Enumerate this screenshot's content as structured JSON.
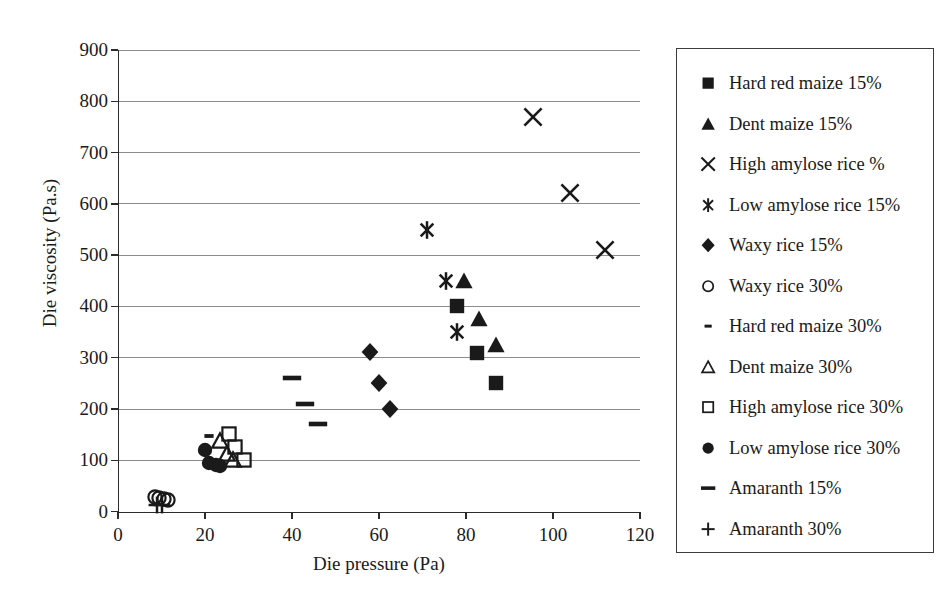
{
  "chart_data": {
    "type": "scatter",
    "title": "",
    "xlabel": "Die pressure (Pa)",
    "ylabel": "Die viscosity (Pa.s)",
    "xlim": [
      0,
      120
    ],
    "ylim": [
      0,
      900
    ],
    "xticks": [
      0,
      20,
      40,
      60,
      80,
      100,
      120
    ],
    "yticks": [
      0,
      100,
      200,
      300,
      400,
      500,
      600,
      700,
      800,
      900
    ],
    "grid": "horizontal",
    "legend_position": "right-outside",
    "series": [
      {
        "name": "Hard red maize 15%",
        "marker": "filled-square",
        "color": "#1a1a1a",
        "points": [
          [
            78,
            400
          ],
          [
            82.5,
            310
          ],
          [
            87,
            250
          ]
        ]
      },
      {
        "name": "Dent maize 15%",
        "marker": "filled-triangle",
        "color": "#1a1a1a",
        "points": [
          [
            79.5,
            450
          ],
          [
            83,
            375
          ],
          [
            87,
            325
          ]
        ]
      },
      {
        "name": "High amylose rice %",
        "marker": "cross-x",
        "color": "#1a1a1a",
        "points": [
          [
            95.5,
            770
          ],
          [
            104,
            622
          ],
          [
            112,
            510
          ]
        ]
      },
      {
        "name": "Low amylose rice 15%",
        "marker": "asterisk",
        "color": "#1a1a1a",
        "points": [
          [
            71,
            550
          ],
          [
            75.5,
            450
          ],
          [
            78,
            350
          ]
        ]
      },
      {
        "name": "Waxy rice 15%",
        "marker": "filled-diamond",
        "color": "#1a1a1a",
        "points": [
          [
            58,
            311
          ],
          [
            60,
            250
          ],
          [
            62.5,
            200
          ]
        ]
      },
      {
        "name": "Waxy rice 30%",
        "marker": "open-circle",
        "color": "#1a1a1a",
        "points": [
          [
            8.5,
            28
          ],
          [
            9.5,
            26
          ],
          [
            10.5,
            24
          ],
          [
            11.5,
            22
          ]
        ]
      },
      {
        "name": "Hard red maize 30%",
        "marker": "short-dash",
        "color": "#1a1a1a",
        "points": [
          [
            21,
            147
          ]
        ]
      },
      {
        "name": "Dent maize 30%",
        "marker": "open-triangle",
        "color": "#1a1a1a",
        "points": [
          [
            23.5,
            138
          ],
          [
            25,
            112
          ],
          [
            26.5,
            100
          ]
        ]
      },
      {
        "name": "High amylose rice 30%",
        "marker": "open-square",
        "color": "#1a1a1a",
        "points": [
          [
            25.5,
            152
          ],
          [
            27,
            125
          ],
          [
            29,
            100
          ]
        ]
      },
      {
        "name": "Low amylose rice 30%",
        "marker": "filled-circle",
        "color": "#1a1a1a",
        "points": [
          [
            20,
            120
          ],
          [
            21,
            95
          ],
          [
            22.5,
            90
          ],
          [
            23.5,
            88
          ]
        ]
      },
      {
        "name": "Amaranth 15%",
        "marker": "long-dash",
        "color": "#1a1a1a",
        "points": [
          [
            40,
            260
          ],
          [
            43,
            210
          ],
          [
            46,
            170
          ]
        ]
      },
      {
        "name": "Amaranth 30%",
        "marker": "plus",
        "color": "#1a1a1a",
        "points": [
          [
            9,
            12
          ],
          [
            10,
            12
          ]
        ]
      }
    ]
  },
  "axes": {
    "x_title": "Die pressure (Pa)",
    "y_title": "Die viscosity (Pa.s)",
    "x_tick_labels": [
      "0",
      "20",
      "40",
      "60",
      "80",
      "100",
      "120"
    ],
    "y_tick_labels": [
      "0",
      "100",
      "200",
      "300",
      "400",
      "500",
      "600",
      "700",
      "800",
      "900"
    ]
  },
  "legend": {
    "items": [
      {
        "label": "Hard red maize 15%",
        "marker": "filled-square"
      },
      {
        "label": "Dent maize 15%",
        "marker": "filled-triangle"
      },
      {
        "label": "High amylose rice %",
        "marker": "cross-x"
      },
      {
        "label": "Low amylose rice 15%",
        "marker": "asterisk"
      },
      {
        "label": "Waxy rice 15%",
        "marker": "filled-diamond"
      },
      {
        "label": "Waxy rice 30%",
        "marker": "open-circle"
      },
      {
        "label": "Hard red maize 30%",
        "marker": "short-dash"
      },
      {
        "label": "Dent maize 30%",
        "marker": "open-triangle"
      },
      {
        "label": "High amylose rice 30%",
        "marker": "open-square"
      },
      {
        "label": "Low amylose rice 30%",
        "marker": "filled-circle"
      },
      {
        "label": "Amaranth 15%",
        "marker": "long-dash"
      },
      {
        "label": "Amaranth 30%",
        "marker": "plus"
      }
    ]
  },
  "colors": {
    "ink": "#1a1a1a",
    "grid": "#8d8d8d",
    "axis": "#2b2b2b",
    "background": "#ffffff"
  }
}
